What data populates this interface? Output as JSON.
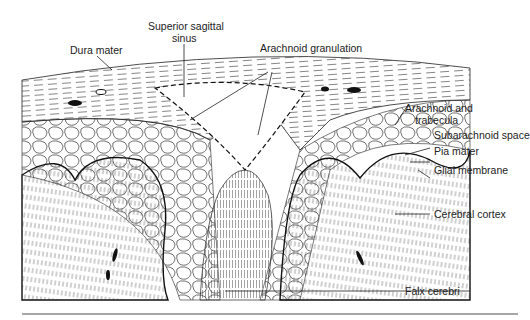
{
  "figure": {
    "labels": {
      "dura_mater": "Dura mater",
      "superior_sagittal_sinus_1": "Superior sagittal",
      "superior_sagittal_sinus_2": "sinus",
      "arachnoid_granulation": "Arachnoid granulation",
      "arachnoid_trabecula_1": "Arachnoid and",
      "arachnoid_trabecula_2": "trabecula",
      "subarachnoid_space": "Subarachnoid space",
      "pia_mater": "Pia mater",
      "glial_membrane": "Glial membrane",
      "cerebral_cortex": "Cerebral cortex",
      "falx_cerebri": "Falx cerebri"
    },
    "colors": {
      "ink": "#222222",
      "paper": "#ffffff",
      "rule": "#888888"
    }
  }
}
